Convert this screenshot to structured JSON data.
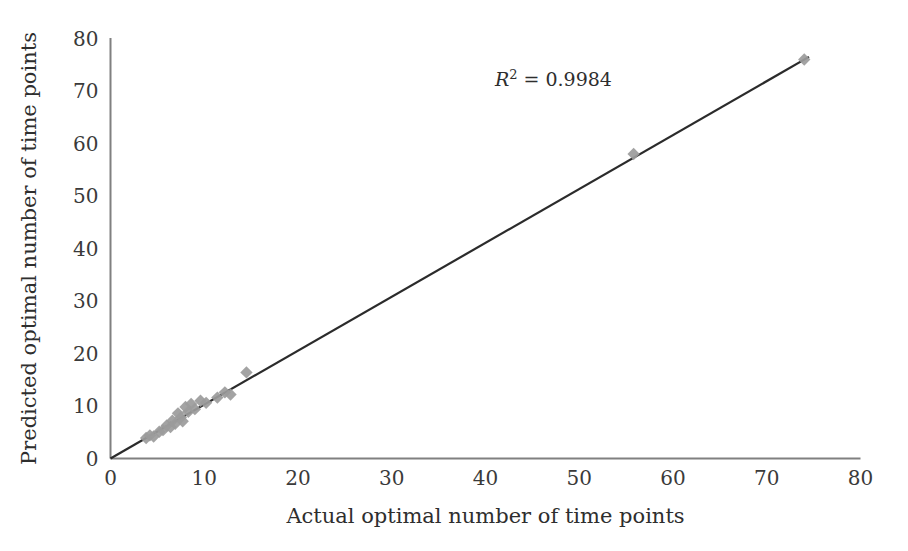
{
  "chart_data": {
    "type": "scatter",
    "title": "",
    "xlabel": "Actual optimal number of time points",
    "ylabel": "Predicted optimal number of time points",
    "xlim": [
      0,
      80
    ],
    "ylim": [
      0,
      80
    ],
    "xticks": [
      0,
      10,
      20,
      30,
      40,
      50,
      60,
      70,
      80
    ],
    "yticks": [
      0,
      10,
      20,
      30,
      40,
      50,
      60,
      70,
      80
    ],
    "xtick_labels": [
      "0",
      "10",
      "20",
      "30",
      "40",
      "50",
      "60",
      "70",
      "80"
    ],
    "ytick_labels": [
      "0",
      "10",
      "20",
      "30",
      "40",
      "50",
      "60",
      "70",
      "80"
    ],
    "grid": false,
    "legend": false,
    "legend_position": "none",
    "marker": "diamond",
    "marker_color": "#9b9b9b",
    "line_color": "#2b2b2b",
    "background_color": "#ffffff",
    "axis_color": "#808080",
    "series": [
      {
        "name": "Predicted vs actual optimal number of time points",
        "points": [
          [
            3.8,
            3.9
          ],
          [
            4.2,
            4.4
          ],
          [
            4.6,
            4.2
          ],
          [
            5.2,
            5.1
          ],
          [
            5.6,
            5.4
          ],
          [
            6.0,
            6.3
          ],
          [
            6.4,
            6.0
          ],
          [
            6.6,
            7.2
          ],
          [
            6.9,
            6.6
          ],
          [
            7.2,
            8.6
          ],
          [
            7.5,
            7.8
          ],
          [
            7.7,
            7.1
          ],
          [
            8.0,
            9.8
          ],
          [
            8.3,
            8.9
          ],
          [
            8.6,
            10.4
          ],
          [
            9.0,
            9.4
          ],
          [
            9.6,
            11.0
          ],
          [
            10.2,
            10.6
          ],
          [
            11.4,
            11.6
          ],
          [
            12.2,
            12.6
          ],
          [
            12.8,
            12.2
          ],
          [
            14.5,
            16.4
          ],
          [
            55.8,
            58.0
          ],
          [
            74.0,
            76.0
          ]
        ]
      }
    ],
    "trendline": {
      "type": "linear",
      "x_start": 0,
      "y_start": 0,
      "x_end": 74.5,
      "y_end": 76.5
    },
    "annotations": [
      {
        "name": "r-squared",
        "prefix": "R",
        "superscript": "2",
        "text": " = 0.9984",
        "full_text": "R2 = 0.9984",
        "x": 41,
        "y": 71
      }
    ]
  }
}
